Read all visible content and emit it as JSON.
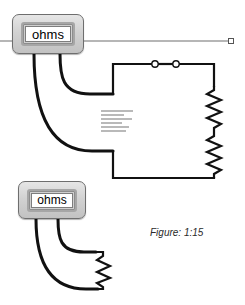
{
  "figure": {
    "caption": "Figure: 1:15",
    "canvas_width": 245,
    "canvas_height": 305
  },
  "devices": [
    {
      "name": "ohmmeter-top",
      "label": "ohms",
      "x": 12,
      "y": 14,
      "w": 72,
      "h": 40
    },
    {
      "name": "ohmmeter-bottom",
      "label": "ohms",
      "x": 18,
      "y": 181,
      "w": 68,
      "h": 38
    }
  ],
  "meter_top": {
    "label": "ohms"
  },
  "meter_bottom": {
    "label": "ohms"
  },
  "circuit": {
    "switch": {
      "terminals": 2,
      "state": "open"
    },
    "resistors_right_branch": 2,
    "resistor_bottom_probe": 1,
    "rect": {
      "left": 113,
      "top": 63,
      "right": 214,
      "bottom": 178
    }
  },
  "placeholder_text": {
    "lines": [
      "",
      "",
      "",
      "",
      "",
      ""
    ],
    "color": "#b9b9b9"
  },
  "guide_line": {
    "name": "horizontal-guide-line",
    "y": 41,
    "x_start": 0,
    "x_end": 228,
    "color": "#6f6f6f"
  },
  "selection_handle": {
    "x": 228,
    "y": 38,
    "size": 6
  },
  "colors": {
    "wire": "#000000",
    "meter_body": "#d2d2d2",
    "meter_border": "#6e6e6e",
    "screen": "#ffffff",
    "guide": "#6f6f6f",
    "placeholder": "#b9b9b9",
    "caption": "#2a2a2a"
  }
}
